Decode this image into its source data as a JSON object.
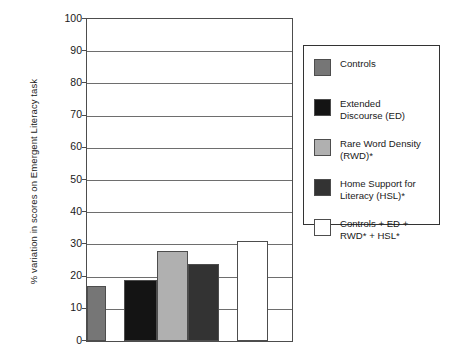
{
  "chart_data": {
    "type": "bar",
    "title": "",
    "subtitle": "",
    "xlabel": "",
    "ylabel": "% variation in scores on Emergent Literacy task",
    "ylim": [
      0,
      100
    ],
    "ytick_labels": [
      "100",
      "90",
      "80",
      "70",
      "60",
      "50",
      "40",
      "30",
      "20",
      "10",
      "0"
    ],
    "ytick_values": [
      100,
      90,
      80,
      70,
      60,
      50,
      40,
      30,
      20,
      10,
      0
    ],
    "grid": true,
    "legend_position": "right",
    "categories": [
      "Controls",
      "Extended Discourse (ED)",
      "Rare Word Density (RWD)*",
      "Home Support for Literacy (HSL)*",
      "Controls + ED + RWD* + HSL*"
    ],
    "values": [
      17,
      19,
      28,
      24,
      31
    ],
    "colors": [
      "#767676",
      "#141414",
      "#b0b0b0",
      "#333333",
      "#ffffff"
    ]
  },
  "legend": {
    "items": [
      {
        "label": "Controls",
        "color": "#767676"
      },
      {
        "label": "Extended\nDiscourse (ED)",
        "color": "#141414"
      },
      {
        "label": "Rare Word Density\n(RWD)*",
        "color": "#b0b0b0"
      },
      {
        "label": "Home Support for\nLiteracy (HSL)*",
        "color": "#333333"
      },
      {
        "label": "Controls + ED +\nRWD* + HSL*",
        "color": "#ffffff"
      }
    ]
  },
  "axis": {
    "y_title": "% variation in scores on Emergent Literacy task"
  }
}
